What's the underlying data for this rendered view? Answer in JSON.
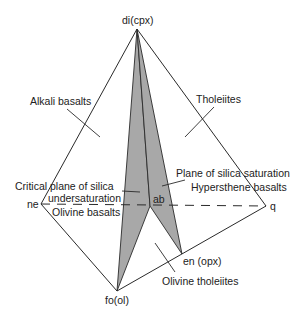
{
  "diagram": {
    "colors": {
      "plane_fill": "#a8a8a8",
      "line": "#2a2a2a",
      "background": "#ffffff"
    },
    "vertices": {
      "di": {
        "label": "di(cpx)",
        "x": 137,
        "y": 29
      },
      "ne": {
        "label": "ne",
        "x": 41,
        "y": 204
      },
      "q": {
        "label": "q",
        "x": 266,
        "y": 206
      },
      "fo": {
        "label": "fo(ol)",
        "x": 117,
        "y": 291
      },
      "en": {
        "label": "en (opx)",
        "x": 182,
        "y": 254
      },
      "ab": {
        "label": "ab",
        "x": 150,
        "y": 206
      }
    },
    "planes": [
      {
        "name": "Critical plane of silica undersaturation",
        "points": [
          "di",
          "ab",
          "fo"
        ]
      },
      {
        "name": "Plane of silica saturation",
        "points": [
          "di",
          "ab",
          "en"
        ]
      }
    ],
    "labels": {
      "alkali_basalts": "Alkali basalts",
      "tholeiites": "Tholeiites",
      "critical_plane_line1": "Critical plane of silica",
      "critical_plane_line2": "undersaturation",
      "olivine_basalts": "Olivine basalts",
      "plane_saturation": "Plane of silica saturation",
      "hypersthene_basalts": "Hypersthene basalts",
      "olivine_tholeiites": "Olivine tholeiites"
    }
  }
}
